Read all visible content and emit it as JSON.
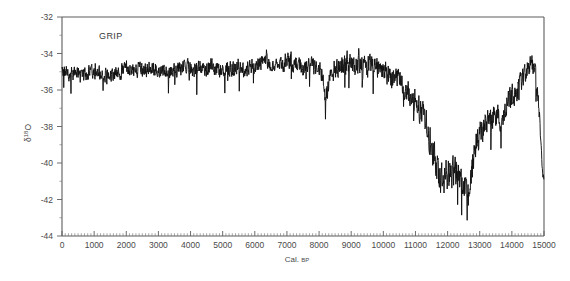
{
  "figure": {
    "background": "#ffffff",
    "series_color": "#111111",
    "axis_color": "#5d5d5d"
  },
  "chart_data": {
    "type": "line",
    "title": "",
    "series_label": "GRIP",
    "xlabel": "Cal. BP",
    "xlabel_main": "Cal.",
    "xlabel_smallcaps": "BP",
    "ylabel": "δ¹18O",
    "ylabel_base": "δ",
    "ylabel_sup": "18",
    "ylabel_tail": "O",
    "xlim": [
      0,
      15000
    ],
    "ylim": [
      -44,
      -32
    ],
    "grid": false,
    "legend": "none",
    "annotations": [
      "GRIP"
    ],
    "xticks": [
      0,
      1000,
      2000,
      3000,
      4000,
      5000,
      6000,
      7000,
      8000,
      9000,
      10000,
      11000,
      12000,
      13000,
      14000,
      15000
    ],
    "xticklabels": [
      "0",
      "1000",
      "2000",
      "3000",
      "4000",
      "5000",
      "6000",
      "7000",
      "8000",
      "9000",
      "10000",
      "11000",
      "12000",
      "13000",
      "14000",
      "15000"
    ],
    "xminor_step": 100,
    "yticks": [
      -32,
      -34,
      -36,
      -38,
      -40,
      -42,
      -44
    ],
    "yticklabels": [
      "-32",
      "-34",
      "-36",
      "-38",
      "-40",
      "-42",
      "-44"
    ],
    "yminor_step": 1,
    "x_units": "calendar years before present",
    "y_units": "per mil (‰)",
    "envelope_note": "High-frequency annual-scale oscillation about a slowly varying baseline",
    "baseline_x": [
      0,
      500,
      1000,
      1500,
      2000,
      2500,
      3000,
      3500,
      4000,
      4500,
      5000,
      5500,
      6000,
      6500,
      7000,
      7300,
      7600,
      7900,
      8100,
      8200,
      8350,
      8600,
      8900,
      9200,
      9500,
      9800,
      10100,
      10400,
      10700,
      11000,
      11200,
      11400,
      11550,
      11700,
      11900,
      12100,
      12300,
      12500,
      12650,
      12750,
      12850,
      12950,
      13100,
      13300,
      13500,
      13700,
      13900,
      14100,
      14300,
      14450,
      14600,
      14700,
      14800,
      14900,
      14950,
      15000
    ],
    "baseline_y": [
      -35.1,
      -35.2,
      -35.0,
      -35.1,
      -34.9,
      -35.0,
      -34.8,
      -34.9,
      -34.8,
      -34.9,
      -34.8,
      -34.7,
      -34.7,
      -34.6,
      -34.5,
      -34.5,
      -34.6,
      -34.8,
      -35.4,
      -36.6,
      -35.3,
      -34.8,
      -34.6,
      -34.5,
      -34.6,
      -34.8,
      -35.1,
      -35.5,
      -36.0,
      -36.6,
      -37.2,
      -38.2,
      -39.6,
      -40.5,
      -40.8,
      -40.7,
      -40.9,
      -41.2,
      -41.6,
      -40.4,
      -39.0,
      -38.6,
      -38.2,
      -37.4,
      -37.2,
      -37.6,
      -36.8,
      -36.4,
      -35.6,
      -34.9,
      -34.5,
      -34.8,
      -36.2,
      -38.6,
      -40.3,
      -41.0
    ],
    "noise_amplitude_x": [
      0,
      7000,
      9000,
      11000,
      11600,
      12600,
      13000,
      14600,
      15000
    ],
    "noise_amplitude_y": [
      0.5,
      0.55,
      0.7,
      0.75,
      1.05,
      1.1,
      0.9,
      0.7,
      0.55
    ],
    "events": [
      {
        "name": "8.2 ka cold event",
        "x": 8200,
        "y": -37.6
      },
      {
        "name": "Younger Dryas",
        "x_range": [
          11550,
          12750
        ],
        "y_mean": -41.0
      },
      {
        "name": "Bølling–Allerød",
        "x_range": [
          12800,
          14700
        ],
        "y_mean": -37.0
      },
      {
        "name": "Holocene plateau",
        "x_range": [
          0,
          10000
        ],
        "y_mean": -34.9
      }
    ]
  }
}
